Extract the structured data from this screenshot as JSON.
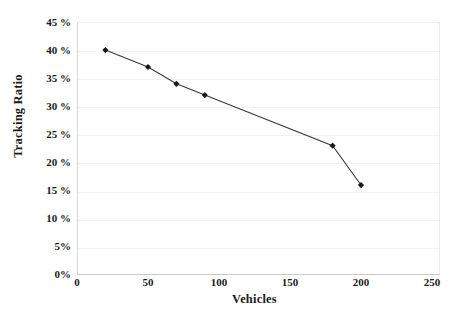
{
  "chart_data": {
    "type": "line",
    "title": "",
    "xlabel": "Vehicles",
    "ylabel": "Tracking Ratio",
    "x": [
      20,
      50,
      70,
      90,
      180,
      200
    ],
    "values": [
      40,
      37,
      34,
      32,
      23,
      16
    ],
    "series": [
      {
        "name": "Tracking Ratio",
        "x": [
          20,
          50,
          70,
          90,
          180,
          200
        ],
        "values": [
          40,
          37,
          34,
          32,
          23,
          16
        ]
      }
    ],
    "xlim": [
      0,
      250
    ],
    "ylim": [
      0,
      45
    ],
    "xticks": [
      0,
      50,
      100,
      150,
      200,
      250
    ],
    "xtick_labels": [
      "0",
      "50",
      "100",
      "150",
      "200",
      "250"
    ],
    "yticks": [
      0,
      5,
      10,
      15,
      20,
      25,
      30,
      35,
      40,
      45
    ],
    "ytick_labels": [
      "0%",
      "5%",
      "10 %",
      "15 %",
      "20 %",
      "25 %",
      "30 %",
      "35 %",
      "40 %",
      "45 %"
    ],
    "grid": "horizontal",
    "legend": "none",
    "marker": "diamond",
    "line_color": "#3a3a3a",
    "marker_color": "#1a1a1a",
    "grid_color": "#f1f1f1",
    "background": "#ffffff",
    "annotations": []
  },
  "axes": {
    "y_title": "Tracking Ratio",
    "x_title": "Vehicles"
  }
}
